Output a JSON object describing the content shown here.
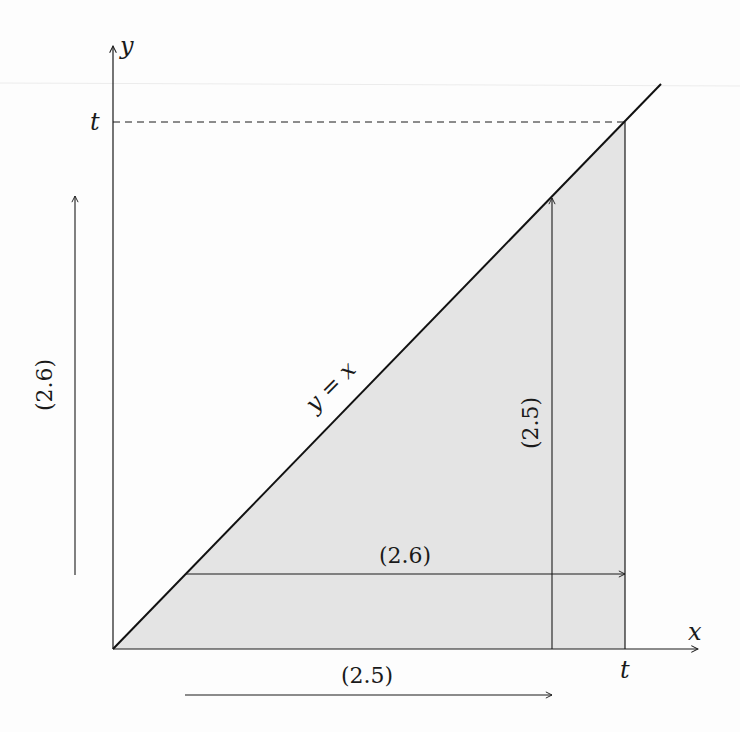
{
  "diagram": {
    "type": "integration-region-figure",
    "colors": {
      "ink": "#1a1a1a",
      "shade": "#e4e4e4",
      "background": "#ffffff"
    },
    "axes": {
      "x_label": "x",
      "y_label": "y",
      "x_tick_label": "t",
      "y_tick_label": "t"
    },
    "line": {
      "label": "y = x"
    },
    "annotations": {
      "horizontal_inner_arrow": "(2.6)",
      "vertical_inner_arrow": "(2.5)",
      "left_outer_arrow": "(2.6)",
      "bottom_outer_arrow": "(2.5)"
    },
    "shaded_region": "triangle bounded by y = x, x-axis, and x = t"
  }
}
